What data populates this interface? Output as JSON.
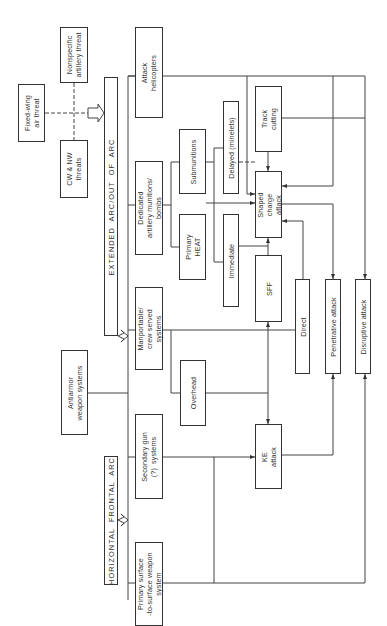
{
  "diagram": {
    "orientation": "rotated-90-ccw",
    "nodes": {
      "fixed_wing": "Fixed-wing\nair threat",
      "cw_nw": "CW & NW\nthreats",
      "nonspecific": "Nonspecific\nartillery threat",
      "extended_arc": "EXTENDED  ARC/OUT  OF  ARC",
      "horizontal_arc": "HORIZONTAL  FRONTAL  ARC",
      "antiarmor": "Antiarmor\nweapon systems",
      "attack_helicopters": "Attack\nhelicopters",
      "dedicated_artillery": "Dedicated\nartillery munitions/\nbombs",
      "manportable": "Manportable/\ncrew served\nsystems",
      "secondary_gun": "Secondary gun\n(?)  systems",
      "primary_surface": "Primary surface\n-to-surface weapon\nsystem",
      "submunitions": "Submunitions",
      "primary_heat": "Primary\nHEAT",
      "delayed": "Delayed (minelets)",
      "immediate": "Immediate",
      "overhead": "Overhead",
      "track_cutting": "Track\ncutting",
      "shaped_charge": "Shaped\ncharge\nattack",
      "sff": "SFF",
      "ke_attack": "KE\nattack",
      "direct": "Direct",
      "penetrative": "Penetrative attack",
      "disruptive": "Disruptive attack"
    }
  }
}
